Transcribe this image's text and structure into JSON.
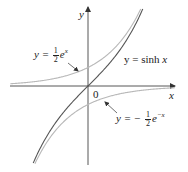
{
  "chart_data": {
    "type": "line",
    "title": "",
    "xlabel": "x",
    "ylabel": "y",
    "origin_label": "0",
    "origin_px": [
      88,
      86
    ],
    "scale_px_per_unit": 37,
    "xlim": [
      -2.1,
      2.35
    ],
    "ylim": [
      -2.1,
      2.1
    ],
    "grid": false,
    "legend": "none",
    "series": [
      {
        "name": "y = sinh x",
        "expr": "sinh(x)",
        "color": "#555555",
        "width": 1.1,
        "x": [
          -1.5,
          -1.25,
          -1.0,
          -0.75,
          -0.5,
          -0.25,
          0,
          0.25,
          0.5,
          0.75,
          1.0,
          1.25,
          1.5
        ],
        "values": [
          -2.13,
          -1.6,
          -1.18,
          -0.82,
          -0.52,
          -0.25,
          0,
          0.25,
          0.52,
          0.82,
          1.18,
          1.6,
          2.13
        ]
      },
      {
        "name": "y = 1/2 e^x",
        "expr": "0.5*exp(x)",
        "color": "#b8b8b8",
        "width": 1.1,
        "x": [
          -2.1,
          -1.5,
          -1.0,
          -0.5,
          0,
          0.5,
          1.0,
          1.5
        ],
        "values": [
          0.06,
          0.11,
          0.18,
          0.3,
          0.5,
          0.82,
          1.36,
          2.24
        ]
      },
      {
        "name": "y = -1/2 e^-x",
        "expr": "-0.5*exp(-x)",
        "color": "#b8b8b8",
        "width": 1.1,
        "x": [
          -1.5,
          -1.0,
          -0.5,
          0,
          0.5,
          1.0,
          1.5,
          2.35
        ],
        "values": [
          -2.24,
          -1.36,
          -0.82,
          -0.5,
          -0.3,
          -0.18,
          -0.11,
          -0.05
        ]
      }
    ],
    "annotations": [
      {
        "text": "y = 1/2 e^x",
        "position": "upper-left",
        "arrow_to_series": "y = 1/2 e^x"
      },
      {
        "text": "y = sinh x",
        "position": "right of y-axis, above x-axis"
      },
      {
        "text": "y = -1/2 e^-x",
        "position": "lower-right",
        "arrow_to_series": "y = -1/2 e^-x"
      }
    ]
  },
  "labels": {
    "y_axis": "y",
    "x_axis": "x",
    "origin": "0",
    "sinh": {
      "lhs": "y = sinh",
      "var": "x"
    },
    "half_exp": {
      "lhs": "y =",
      "num": "1",
      "den": "2",
      "base": "e",
      "exp": "x"
    },
    "neg_half_exp": {
      "lhs": "y = −",
      "num": "1",
      "den": "2",
      "base": "e",
      "exp": "−x"
    }
  },
  "colors": {
    "axis": "#444444",
    "sinh": "#555555",
    "exp_curves": "#b8b8b8",
    "text": "#222222"
  }
}
